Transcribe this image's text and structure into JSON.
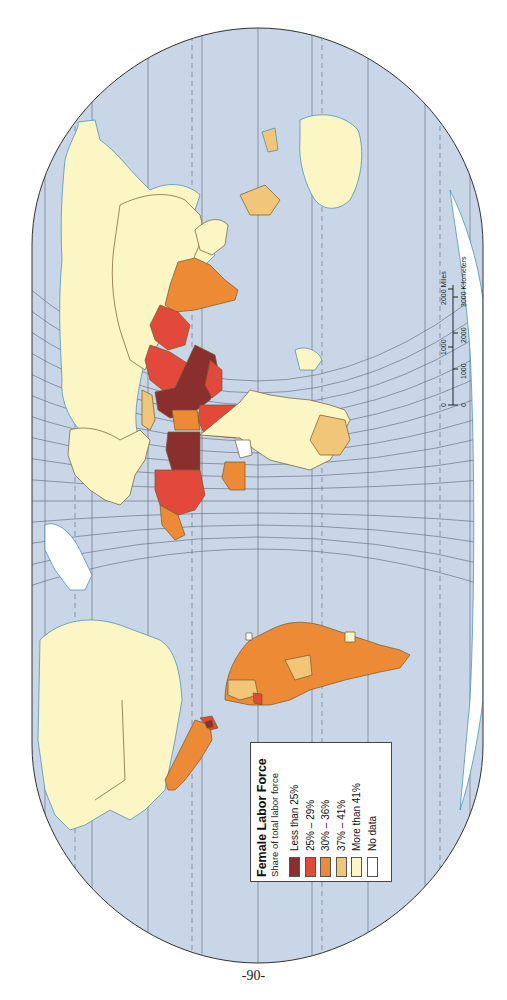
{
  "map": {
    "title": "Female Labor Force",
    "subtitle": "Share of total labor force",
    "orientation": "rotated 90° clockwise (north to the left)",
    "colors": {
      "ocean": "#c9d6e8",
      "graticule": "#5a6677",
      "coast": "#3a8ab5",
      "border": "#6e5a2e"
    }
  },
  "legend": {
    "title": "Female Labor Force",
    "subtitle": "Share of total labor force",
    "items": [
      {
        "label": "Less than 25%",
        "color": "#8b2e2e"
      },
      {
        "label": "25% – 29%",
        "color": "#e2493a"
      },
      {
        "label": "30% – 36%",
        "color": "#ed8a35"
      },
      {
        "label": "37% – 41%",
        "color": "#f2c679"
      },
      {
        "label": "More than 41%",
        "color": "#fcf5c4"
      },
      {
        "label": "No data",
        "color": "#ffffff"
      }
    ]
  },
  "scale_bar": {
    "miles_ticks": [
      "0",
      "1000",
      "2000 Miles"
    ],
    "km_ticks": [
      "0",
      "1000",
      "2000",
      "3000 Kilometers"
    ]
  },
  "page_number": "-90-"
}
